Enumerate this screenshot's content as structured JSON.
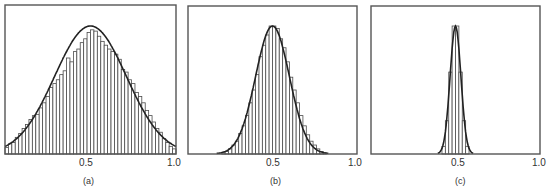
{
  "chart_data": [
    {
      "type": "bar",
      "panel_label": "(a)",
      "title": "",
      "xlabel": "",
      "ylabel": "",
      "xlim": [
        0,
        1
      ],
      "x_tick_labels": [
        "0.5",
        "1.0"
      ],
      "x_ticks": [
        0.5,
        1.0
      ],
      "grid": false,
      "legend": null,
      "overlay": {
        "type": "gaussian",
        "mean": 0.5,
        "sigma": 0.21
      },
      "bin_count": 50,
      "values_relative_to_curve_peak": [
        0.05,
        0.08,
        0.09,
        0.13,
        0.16,
        0.2,
        0.23,
        0.27,
        0.3,
        0.31,
        0.36,
        0.4,
        0.45,
        0.52,
        0.55,
        0.58,
        0.62,
        0.65,
        0.75,
        0.72,
        0.8,
        0.82,
        0.87,
        0.9,
        0.95,
        0.97,
        0.96,
        0.92,
        0.88,
        0.85,
        0.82,
        0.8,
        0.78,
        0.74,
        0.66,
        0.64,
        0.58,
        0.55,
        0.48,
        0.45,
        0.4,
        0.34,
        0.3,
        0.25,
        0.2,
        0.17,
        0.12,
        0.09,
        0.06,
        0.04
      ]
    },
    {
      "type": "bar",
      "panel_label": "(b)",
      "title": "",
      "xlabel": "",
      "ylabel": "",
      "xlim": [
        0,
        1
      ],
      "x_tick_labels": [
        "0.5",
        "1.0"
      ],
      "x_ticks": [
        0.5,
        1.0
      ],
      "grid": false,
      "legend": null,
      "overlay": {
        "type": "gaussian",
        "mean": 0.5,
        "sigma": 0.1
      },
      "bin_count": 50,
      "values_relative_to_curve_peak": [
        0,
        0,
        0,
        0,
        0,
        0,
        0,
        0,
        0,
        0,
        0.01,
        0.02,
        0.04,
        0.07,
        0.1,
        0.16,
        0.22,
        0.3,
        0.4,
        0.5,
        0.62,
        0.76,
        0.85,
        0.93,
        1.0,
        1.0,
        0.98,
        0.9,
        0.83,
        0.72,
        0.6,
        0.5,
        0.4,
        0.3,
        0.22,
        0.15,
        0.1,
        0.07,
        0.04,
        0.02,
        0.01,
        0,
        0,
        0,
        0,
        0,
        0,
        0,
        0,
        0
      ]
    },
    {
      "type": "bar",
      "panel_label": "(c)",
      "title": "",
      "xlabel": "",
      "ylabel": "",
      "xlim": [
        0,
        1
      ],
      "x_tick_labels": [
        "0.5",
        "1.0"
      ],
      "x_ticks": [
        0.5,
        1.0
      ],
      "grid": false,
      "legend": null,
      "overlay": {
        "type": "gaussian",
        "mean": 0.5,
        "sigma": 0.032
      },
      "bin_count": 50,
      "values_relative_to_curve_peak": [
        0,
        0,
        0,
        0,
        0,
        0,
        0,
        0,
        0,
        0,
        0,
        0,
        0,
        0,
        0,
        0,
        0,
        0,
        0,
        0,
        0,
        0.06,
        0.26,
        0.64,
        1.0,
        1.0,
        0.64,
        0.26,
        0.06,
        0,
        0,
        0,
        0,
        0,
        0,
        0,
        0,
        0,
        0,
        0,
        0,
        0,
        0,
        0,
        0,
        0,
        0,
        0,
        0,
        0
      ]
    }
  ],
  "panels": [
    {
      "label": "(a)",
      "tick_mid": "0.5",
      "tick_end": "1.0"
    },
    {
      "label": "(b)",
      "tick_mid": "0.5",
      "tick_end": "1.0"
    },
    {
      "label": "(c)",
      "tick_mid": "0.5",
      "tick_end": "1.0"
    }
  ]
}
